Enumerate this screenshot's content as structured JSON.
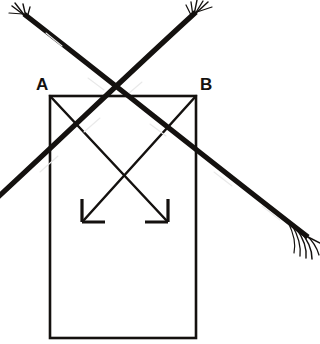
{
  "figure": {
    "width": 320,
    "height": 344,
    "background_color": "#ffffff",
    "ink_color": "#14110f"
  },
  "labels": {
    "vertex_a": "A",
    "vertex_b": "B"
  },
  "shapes": {
    "rectangle": {
      "name": "block-outline",
      "x": 50,
      "y": 96,
      "width": 146,
      "height": 242,
      "stroke_width": 2.4,
      "fill": "none"
    }
  },
  "thin_arrows": [
    {
      "name": "arrow-a-to-lower-right",
      "from_x": 50,
      "from_y": 96,
      "to_x": 168,
      "to_y": 222,
      "head": "down-right",
      "stroke_width": 2.4
    },
    {
      "name": "arrow-b-to-lower-left",
      "from_x": 196,
      "from_y": 96,
      "to_x": 82,
      "to_y": 222,
      "head": "down-left",
      "stroke_width": 2.4
    }
  ],
  "thick_strokes": [
    {
      "name": "frayed-stroke-descending",
      "from_x": 22,
      "from_y": 12,
      "to_x": 311,
      "to_y": 238,
      "frayed_end": "both",
      "stroke_width": 5
    },
    {
      "name": "frayed-stroke-ascending",
      "from_x": 0,
      "from_y": 196,
      "to_x": 199,
      "to_y": 9,
      "frayed_end": "top",
      "stroke_width": 5
    }
  ],
  "crossings": {
    "thick_cross_x": 118,
    "thick_cross_y": 88,
    "thin_cross_x": 124,
    "thin_cross_y": 161
  }
}
